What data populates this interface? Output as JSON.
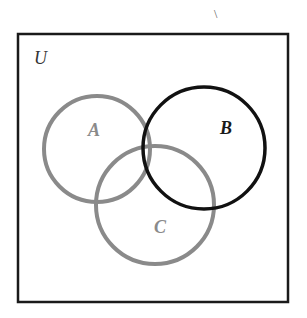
{
  "diagram": {
    "type": "venn",
    "universe": {
      "label": "U",
      "x": 18,
      "y": 34,
      "width": 270,
      "height": 268,
      "stroke": "#1a1a1a"
    },
    "sets": [
      {
        "label": "A",
        "cx": 97,
        "cy": 149,
        "r": 53,
        "stroke": "#8a8a8a",
        "label_x": 88,
        "label_y": 136,
        "label_color": "#8a8a8a"
      },
      {
        "label": "B",
        "cx": 204,
        "cy": 148,
        "r": 61,
        "stroke": "#111111",
        "label_x": 220,
        "label_y": 134,
        "label_color": "#1a1a1a"
      },
      {
        "label": "C",
        "cx": 155,
        "cy": 205,
        "r": 59,
        "stroke": "#8a8a8a",
        "label_x": 154,
        "label_y": 233,
        "label_color": "#8a8a8a"
      }
    ],
    "stray_mark": "\\"
  }
}
